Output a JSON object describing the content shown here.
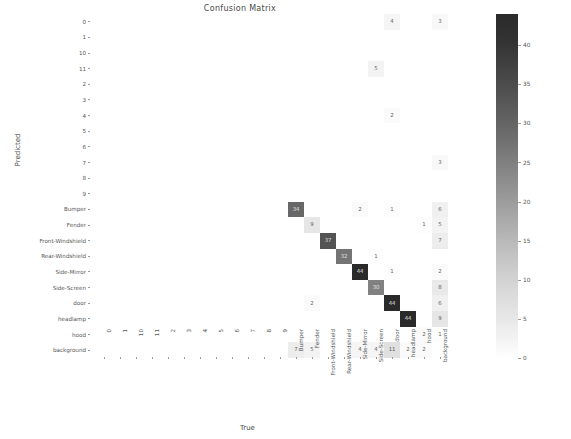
{
  "figure": {
    "title": "Confusion Matrix",
    "xlabel": "True",
    "ylabel": "Predicted"
  },
  "colorbar": {
    "ticks": [
      "0",
      "5",
      "10",
      "15",
      "20",
      "25",
      "30",
      "35",
      "40"
    ],
    "vmin": 0,
    "vmax": 44,
    "colormap_low": "#ffffff",
    "colormap_high": "#2a2a2a"
  },
  "chart_data": {
    "type": "heatmap",
    "title": "Confusion Matrix",
    "xlabel": "True",
    "ylabel": "Predicted",
    "grid": false,
    "legend": "colorbar-right",
    "zlim": [
      0,
      44
    ],
    "x_categories": [
      "0",
      "1",
      "10",
      "11",
      "2",
      "3",
      "4",
      "5",
      "6",
      "7",
      "8",
      "9",
      "Bumper",
      "Fender",
      "Front-Windshield",
      "Rear-Windshield",
      "Side-Mirror",
      "Side-Screen",
      "door",
      "headlamp",
      "hood",
      "background"
    ],
    "y_categories": [
      "0",
      "1",
      "10",
      "11",
      "2",
      "3",
      "4",
      "5",
      "6",
      "7",
      "8",
      "9",
      "Bumper",
      "Fender",
      "Front-Windshield",
      "Rear-Windshield",
      "Side-Mirror",
      "Side-Screen",
      "door",
      "headlamp",
      "hood",
      "background"
    ],
    "values": [
      [
        0,
        0,
        0,
        0,
        0,
        0,
        0,
        0,
        0,
        0,
        0,
        0,
        0,
        0,
        0,
        0,
        0,
        0,
        4,
        0,
        0,
        3
      ],
      [
        0,
        0,
        0,
        0,
        0,
        0,
        0,
        0,
        0,
        0,
        0,
        0,
        0,
        0,
        0,
        0,
        0,
        0,
        0,
        0,
        0,
        0
      ],
      [
        0,
        0,
        0,
        0,
        0,
        0,
        0,
        0,
        0,
        0,
        0,
        0,
        0,
        0,
        0,
        0,
        0,
        0,
        0,
        0,
        0,
        0
      ],
      [
        0,
        0,
        0,
        0,
        0,
        0,
        0,
        0,
        0,
        0,
        0,
        0,
        0,
        0,
        0,
        0,
        0,
        5,
        0,
        0,
        0,
        0
      ],
      [
        0,
        0,
        0,
        0,
        0,
        0,
        0,
        0,
        0,
        0,
        0,
        0,
        0,
        0,
        0,
        0,
        0,
        0,
        0,
        0,
        0,
        0
      ],
      [
        0,
        0,
        0,
        0,
        0,
        0,
        0,
        0,
        0,
        0,
        0,
        0,
        0,
        0,
        0,
        0,
        0,
        0,
        0,
        0,
        0,
        0
      ],
      [
        0,
        0,
        0,
        0,
        0,
        0,
        0,
        0,
        0,
        0,
        0,
        0,
        0,
        0,
        0,
        0,
        0,
        0,
        2,
        0,
        0,
        0
      ],
      [
        0,
        0,
        0,
        0,
        0,
        0,
        0,
        0,
        0,
        0,
        0,
        0,
        0,
        0,
        0,
        0,
        0,
        0,
        0,
        0,
        0,
        0
      ],
      [
        0,
        0,
        0,
        0,
        0,
        0,
        0,
        0,
        0,
        0,
        0,
        0,
        0,
        0,
        0,
        0,
        0,
        0,
        0,
        0,
        0,
        0
      ],
      [
        0,
        0,
        0,
        0,
        0,
        0,
        0,
        0,
        0,
        0,
        0,
        0,
        0,
        0,
        0,
        0,
        0,
        0,
        0,
        0,
        0,
        3
      ],
      [
        0,
        0,
        0,
        0,
        0,
        0,
        0,
        0,
        0,
        0,
        0,
        0,
        0,
        0,
        0,
        0,
        0,
        0,
        0,
        0,
        0,
        0
      ],
      [
        0,
        0,
        0,
        0,
        0,
        0,
        0,
        0,
        0,
        0,
        0,
        0,
        0,
        0,
        0,
        0,
        0,
        0,
        0,
        0,
        0,
        0
      ],
      [
        0,
        0,
        0,
        0,
        0,
        0,
        0,
        0,
        0,
        0,
        0,
        0,
        34,
        0,
        0,
        0,
        2,
        0,
        1,
        0,
        0,
        6
      ],
      [
        0,
        0,
        0,
        0,
        0,
        0,
        0,
        0,
        0,
        0,
        0,
        0,
        0,
        9,
        0,
        0,
        0,
        0,
        0,
        0,
        1,
        5
      ],
      [
        0,
        0,
        0,
        0,
        0,
        0,
        0,
        0,
        0,
        0,
        0,
        0,
        0,
        0,
        37,
        0,
        0,
        0,
        0,
        0,
        0,
        7
      ],
      [
        0,
        0,
        0,
        0,
        0,
        0,
        0,
        0,
        0,
        0,
        0,
        0,
        0,
        0,
        0,
        32,
        0,
        1,
        0,
        0,
        0,
        0
      ],
      [
        0,
        0,
        0,
        0,
        0,
        0,
        0,
        0,
        0,
        0,
        0,
        0,
        0,
        0,
        0,
        0,
        44,
        0,
        1,
        0,
        0,
        2
      ],
      [
        0,
        0,
        0,
        0,
        0,
        0,
        0,
        0,
        0,
        0,
        0,
        0,
        0,
        0,
        0,
        0,
        0,
        30,
        0,
        0,
        0,
        8
      ],
      [
        0,
        0,
        0,
        0,
        0,
        0,
        0,
        0,
        0,
        0,
        0,
        0,
        0,
        2,
        0,
        0,
        0,
        0,
        44,
        0,
        0,
        6
      ],
      [
        0,
        0,
        0,
        0,
        0,
        0,
        0,
        0,
        0,
        0,
        0,
        0,
        0,
        0,
        0,
        0,
        0,
        0,
        0,
        44,
        0,
        9
      ],
      [
        0,
        0,
        0,
        0,
        0,
        0,
        0,
        0,
        0,
        0,
        0,
        0,
        0,
        0,
        0,
        0,
        0,
        0,
        0,
        0,
        2,
        1
      ],
      [
        0,
        0,
        0,
        0,
        0,
        0,
        0,
        0,
        0,
        0,
        0,
        0,
        7,
        5,
        0,
        0,
        4,
        4,
        11,
        2,
        2,
        0
      ]
    ]
  }
}
